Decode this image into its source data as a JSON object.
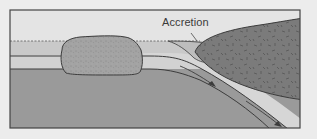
{
  "diagram": {
    "labels": {
      "accretion": "Accretion"
    },
    "regions": {
      "sky": "sky",
      "ocean": "ocean-water",
      "oceanic_plate": "oceanic-lithosphere",
      "mantle": "mantle",
      "microcontinent": "microcontinent",
      "continent": "continental-block",
      "slab": "subducting-slab",
      "wedge": "accretionary-wedge"
    },
    "arrows": [
      {
        "name": "subduction-arrow-upper",
        "direction": "down-right"
      },
      {
        "name": "subduction-arrow-lower",
        "direction": "down-right"
      }
    ],
    "colors": {
      "background": "#ececec",
      "sky": "#e4e4e4",
      "ocean": "#c9c9c9",
      "plate": "#d2d2d2",
      "mantle": "#9a9a9a",
      "microcontinent": "#a3a3a3",
      "continent": "#7b7b7b",
      "slab": "#d6d6d6",
      "outline": "#3c3c3c"
    }
  }
}
